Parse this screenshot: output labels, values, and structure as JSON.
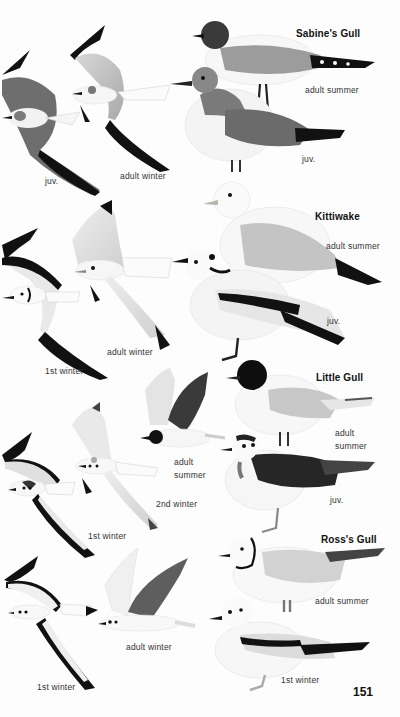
{
  "page": {
    "page_number": "151",
    "species": [
      {
        "name": "Sabine's Gull",
        "figures": [
          {
            "label": "juv.",
            "pose": "flight"
          },
          {
            "label": "adult winter",
            "pose": "flight"
          },
          {
            "label": "adult summer",
            "pose": "standing"
          },
          {
            "label": "juv.",
            "pose": "standing"
          }
        ]
      },
      {
        "name": "Kittiwake",
        "figures": [
          {
            "label": "1st winter",
            "pose": "flight"
          },
          {
            "label": "adult winter",
            "pose": "flight"
          },
          {
            "label": "adult summer",
            "pose": "standing"
          },
          {
            "label": "juv.",
            "pose": "standing"
          }
        ]
      },
      {
        "name": "Little Gull",
        "figures": [
          {
            "label": "1st winter",
            "pose": "flight"
          },
          {
            "label": "2nd winter",
            "pose": "flight"
          },
          {
            "label": "adult summer",
            "pose": "flight"
          },
          {
            "label": "adult summer",
            "pose": "standing"
          },
          {
            "label": "juv.",
            "pose": "standing"
          }
        ]
      },
      {
        "name": "Ross's Gull",
        "figures": [
          {
            "label": "1st winter",
            "pose": "flight"
          },
          {
            "label": "adult winter",
            "pose": "flight"
          },
          {
            "label": "adult summer",
            "pose": "standing"
          },
          {
            "label": "1st winter",
            "pose": "standing"
          }
        ]
      }
    ]
  },
  "colors": {
    "background": "#fdfdfd",
    "ink": "#111111",
    "wing_grey": "#b8b8b8",
    "dark_grey": "#5a5a5a"
  }
}
